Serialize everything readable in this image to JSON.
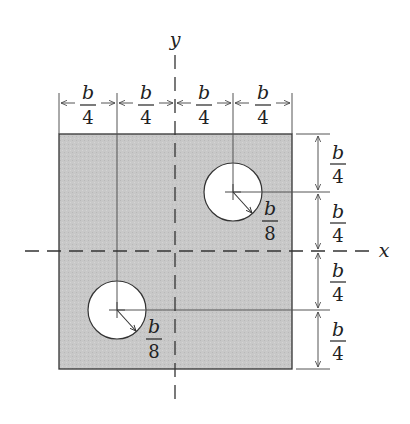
{
  "figure": {
    "axes": {
      "x_label": "x",
      "y_label": "y"
    },
    "plate": {
      "fill": "#c9c9c9",
      "stroke": "#333333"
    },
    "top_dimensions": [
      {
        "num": "b",
        "den": "4"
      },
      {
        "num": "b",
        "den": "4"
      },
      {
        "num": "b",
        "den": "4"
      },
      {
        "num": "b",
        "den": "4"
      }
    ],
    "right_dimensions": [
      {
        "num": "b",
        "den": "4"
      },
      {
        "num": "b",
        "den": "4"
      },
      {
        "num": "b",
        "den": "4"
      },
      {
        "num": "b",
        "den": "4"
      }
    ],
    "holes": [
      {
        "name": "upper-right",
        "radius_label": {
          "num": "b",
          "den": "8"
        }
      },
      {
        "name": "lower-left",
        "radius_label": {
          "num": "b",
          "den": "8"
        }
      }
    ]
  }
}
